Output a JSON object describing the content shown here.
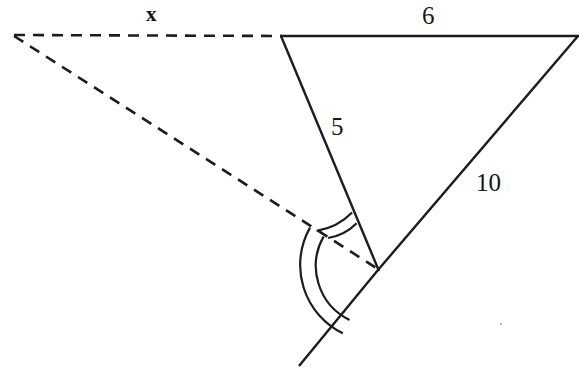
{
  "figure": {
    "type": "geometry-diagram",
    "width": 579,
    "height": 378,
    "background_color": "#ffffff",
    "ink_color": "#1c1c20",
    "item_number": ")",
    "labels": [
      {
        "id": "x",
        "text": "x",
        "role": "unknown-side-length",
        "belongs_to": "dashed-top-segment"
      },
      {
        "id": "6",
        "text": "6",
        "role": "side-length",
        "belongs_to": "solid-top-segment"
      },
      {
        "id": "5",
        "text": "5",
        "role": "side-length",
        "belongs_to": "solid-left-segment"
      },
      {
        "id": "10",
        "text": "10",
        "role": "side-length",
        "belongs_to": "solid-right-segment"
      }
    ],
    "vertices": {
      "left_dashed": [
        14,
        35
      ],
      "top_middle": [
        281,
        36
      ],
      "top_right": [
        577,
        36
      ],
      "bottom": [
        378,
        270
      ],
      "ray_end_bottom_left": [
        300,
        365
      ]
    },
    "segments": [
      {
        "name": "dashed-top-segment",
        "style": "dashed",
        "from": "left_dashed",
        "to": "top_middle",
        "label": "x"
      },
      {
        "name": "dashed-diagonal-segment",
        "style": "dashed",
        "from": "left_dashed",
        "to": "bottom",
        "label": ""
      },
      {
        "name": "solid-top-segment",
        "style": "solid",
        "from": "top_middle",
        "to": "top_right",
        "label": "6"
      },
      {
        "name": "solid-left-segment",
        "style": "solid",
        "from": "top_middle",
        "to": "bottom",
        "label": "5"
      },
      {
        "name": "solid-right-segment",
        "style": "solid",
        "from": "top_right",
        "to": "bottom",
        "label": "10"
      },
      {
        "name": "solid-extension-ray",
        "style": "solid",
        "from": "bottom",
        "to": "ray_end_bottom_left",
        "label": ""
      }
    ],
    "angle_marks": [
      {
        "name": "upper-angle-mark",
        "vertex": "bottom",
        "arcs": 2,
        "between": [
          "solid-left-segment",
          "dashed-diagonal-segment"
        ]
      },
      {
        "name": "lower-angle-mark",
        "vertex": "bottom",
        "arcs": 2,
        "between": [
          "dashed-diagonal-segment",
          "solid-extension-ray"
        ]
      }
    ]
  }
}
